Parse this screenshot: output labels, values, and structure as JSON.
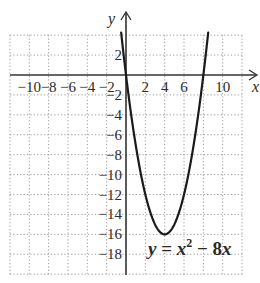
{
  "chart_data": {
    "type": "line",
    "title": "",
    "xlabel": "x",
    "ylabel": "y",
    "xlim": [
      -12,
      12
    ],
    "ylim": [
      -20,
      4
    ],
    "grid": true,
    "grid_step": 2,
    "x_ticks": [
      -10,
      -8,
      -6,
      -4,
      -2,
      2,
      4,
      6,
      10
    ],
    "x_tick_labels": [
      "−10",
      "−8",
      "−6",
      "−4",
      "−2",
      "2",
      "4",
      "6",
      "10"
    ],
    "y_ticks": [
      2,
      -2,
      -4,
      -6,
      -8,
      -10,
      -12,
      -14,
      -16,
      -18
    ],
    "y_tick_labels": [
      "2",
      "−2",
      "−4",
      "−6",
      "−8",
      "−10",
      "−12",
      "−14",
      "−16",
      "−18"
    ],
    "series": [
      {
        "name": "y = x^2 - 8x",
        "function": "x^2 - 8x",
        "domain": [
          -0.5,
          8.5
        ],
        "x": [
          -0.5,
          0,
          1,
          2,
          3,
          4,
          5,
          6,
          7,
          8,
          8.5
        ],
        "values": [
          4.25,
          0,
          -7,
          -12,
          -15,
          -16,
          -15,
          -12,
          -7,
          0,
          4.25
        ],
        "vertex": [
          4,
          -16
        ],
        "x_intercepts": [
          0,
          8
        ]
      }
    ],
    "annotations": [
      {
        "text": "y = x² − 8x",
        "position": [
          6.5,
          -18
        ]
      }
    ]
  },
  "labels": {
    "x_axis": "x",
    "y_axis": "y",
    "equation_y": "y",
    "equation_eq": " = ",
    "equation_x": "x",
    "equation_exp": "2",
    "equation_rest": " − 8",
    "equation_x2": "x"
  },
  "colors": {
    "curve": "#1a1a1a",
    "axis": "#333333",
    "grid": "#9a9a9a",
    "text": "#2a2a2a",
    "background": "#ffffff"
  }
}
